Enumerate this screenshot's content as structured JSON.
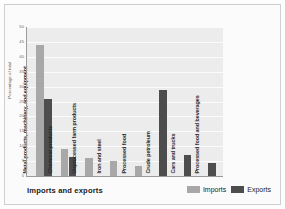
{
  "chart_data": {
    "type": "bar",
    "title": "Imports and exports",
    "xlabel": "",
    "ylabel": "Percentage of total",
    "ylim": [
      0,
      50
    ],
    "ytick_step": 5,
    "yticks": [
      50,
      45,
      40,
      35,
      30,
      25,
      20,
      15,
      10,
      5,
      0
    ],
    "grid": true,
    "legend_position": "bottom-right",
    "categories": [
      "Metal products, machinery, and equipment",
      "Chemical products",
      "Unprocessed farm products",
      "Iron and steel",
      "Processed food",
      "Crude petroleum",
      "Cars and trucks",
      "Processed food and beverages"
    ],
    "series": [
      {
        "name": "Imports",
        "color": "#a8a8a8",
        "values": [
          44,
          9,
          6,
          5,
          3.5,
          null,
          null,
          null
        ]
      },
      {
        "name": "Exports",
        "color": "#4d4d4d",
        "values": [
          26,
          6.5,
          null,
          null,
          null,
          29,
          7,
          4.5
        ]
      }
    ]
  },
  "legend": {
    "items": [
      {
        "label": "Imports",
        "swatch": "imports"
      },
      {
        "label": "Exports",
        "swatch": "exports"
      }
    ]
  },
  "colors": {
    "imports": "#a8a8a8",
    "exports": "#4d4d4d",
    "plot_background": "#ececec",
    "gridline": "#fbfbfb",
    "axis": "#9a9a9a"
  }
}
